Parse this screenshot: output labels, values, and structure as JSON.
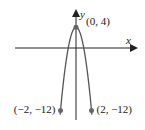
{
  "chart_data": {
    "type": "line",
    "title": "",
    "function": "y = 4 - 4x^2",
    "xlabel": "x",
    "ylabel": "y",
    "grid": false,
    "legend": null,
    "xlim": [
      -9.5,
      7.5
    ],
    "ylim": [
      -14.5,
      6.8
    ],
    "series": [
      {
        "name": "parabola",
        "x": [
          -2,
          -1.5,
          -1,
          -0.5,
          0,
          0.5,
          1,
          1.5,
          2
        ],
        "y": [
          -12,
          -5,
          0,
          3,
          4,
          3,
          0,
          -5,
          -12
        ]
      }
    ],
    "points": [
      {
        "x": 0,
        "y": 4,
        "label": "(0, 4)"
      },
      {
        "x": -2,
        "y": -12,
        "label": "(−2, −12)"
      },
      {
        "x": 2,
        "y": -12,
        "label": "(2, −12)"
      }
    ]
  },
  "colors": {
    "curve": "#555555",
    "axis": "#222222",
    "point": "#666666"
  }
}
